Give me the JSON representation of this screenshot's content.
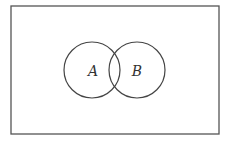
{
  "diagram": {
    "type": "venn",
    "universe": {
      "x": 11,
      "y": 6,
      "width": 208,
      "height": 128,
      "stroke": "#555555"
    },
    "sets": [
      {
        "label": "A",
        "cx": 92,
        "cy": 70,
        "r": 28,
        "stroke": "#444444"
      },
      {
        "label": "B",
        "cx": 137,
        "cy": 70,
        "r": 28,
        "stroke": "#444444"
      }
    ]
  }
}
